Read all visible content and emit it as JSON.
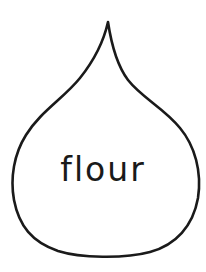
{
  "drop": {
    "label": "flour",
    "stroke_color": "#1a1a1a",
    "fill_color": "#ffffff"
  }
}
